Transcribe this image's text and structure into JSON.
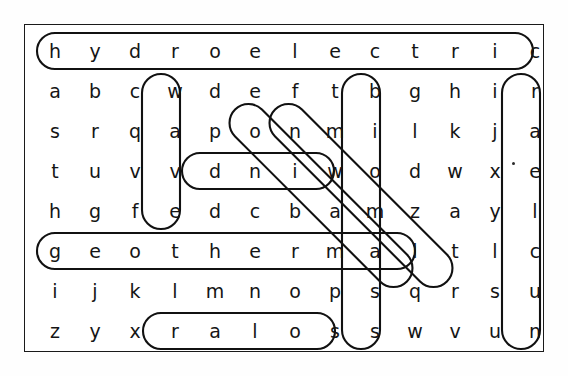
{
  "puzzle": {
    "title": "word-search-grid",
    "rows": 8,
    "cols": 13,
    "grid": [
      [
        "h",
        "y",
        "d",
        "r",
        "o",
        "e",
        "l",
        "e",
        "c",
        "t",
        "r",
        "i",
        "c"
      ],
      [
        "a",
        "b",
        "c",
        "w",
        "d",
        "e",
        "f",
        "t",
        "b",
        "g",
        "h",
        "i",
        "r"
      ],
      [
        "s",
        "r",
        "q",
        "a",
        "p",
        "o",
        "n",
        "m",
        "i",
        "l",
        "k",
        "j",
        "a"
      ],
      [
        "t",
        "u",
        "v",
        "v",
        "d",
        "n",
        "i",
        "w",
        "o",
        "d",
        "w",
        "x",
        "e"
      ],
      [
        "h",
        "g",
        "f",
        "e",
        "d",
        "c",
        "b",
        "a",
        "m",
        "z",
        "a",
        "y",
        "l"
      ],
      [
        "g",
        "e",
        "o",
        "t",
        "h",
        "e",
        "r",
        "m",
        "a",
        "l",
        "t",
        "l",
        "c"
      ],
      [
        "i",
        "j",
        "k",
        "l",
        "m",
        "n",
        "o",
        "p",
        "s",
        "q",
        "r",
        "s",
        "u"
      ],
      [
        "z",
        "y",
        "x",
        "r",
        "a",
        "l",
        "o",
        "s",
        "s",
        "w",
        "v",
        "u",
        "n"
      ]
    ],
    "found_words": [
      {
        "name": "hydroelectric",
        "text": "hydroelectric",
        "orientation": "horizontal",
        "row": 1,
        "col_start": 1,
        "col_end": 13
      },
      {
        "name": "wave",
        "text": "wave",
        "orientation": "vertical",
        "col": 4,
        "row_start": 2,
        "row_end": 5
      },
      {
        "name": "wind",
        "text": "wind",
        "display": "dniw",
        "orientation": "horizontal-reversed",
        "row": 4,
        "col_start": 5,
        "col_end": 8
      },
      {
        "name": "geothermal",
        "text": "geothermal",
        "orientation": "horizontal",
        "row": 6,
        "col_start": 1,
        "col_end": 10
      },
      {
        "name": "solar",
        "text": "solar",
        "display": "ralos",
        "orientation": "horizontal-reversed",
        "row": 8,
        "col_start": 4,
        "col_end": 8
      },
      {
        "name": "biomass",
        "text": "biomass",
        "orientation": "vertical",
        "col": 9,
        "row_start": 2,
        "row_end": 8
      },
      {
        "name": "nuclear",
        "text": "nuclear",
        "display": "raelcun",
        "orientation": "vertical-reversed",
        "col": 13,
        "row_start": 2,
        "row_end": 8
      },
      {
        "name": "tidal",
        "text": "tidal",
        "display": "tidal",
        "orientation": "diagonal",
        "row_start": 2,
        "col_start": 8,
        "row_end": 6,
        "col_end": 12
      },
      {
        "name": "biodiesel-diagonal",
        "text": "bidal",
        "orientation": "diagonal",
        "row_start": 2,
        "col_start": 9,
        "row_end": 6,
        "col_end": 13
      }
    ],
    "colors": {
      "ink": "#151515",
      "marker": "#111111",
      "frame": "#1a1a1a",
      "paper": "#ffffff"
    }
  }
}
